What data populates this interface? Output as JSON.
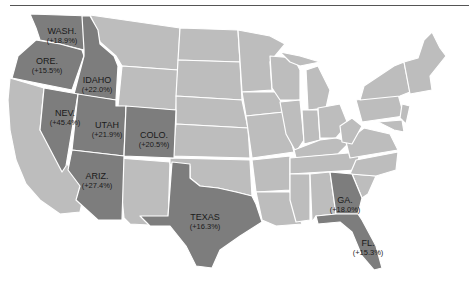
{
  "map": {
    "subject": "United States",
    "highlight_color": "#7d7d7d",
    "base_color": "#bdbdbd",
    "border_color": "#ffffff",
    "highlighted_states": [
      {
        "name": "WASH.",
        "value": "(+18.9%)"
      },
      {
        "name": "ORE.",
        "value": "(+15.5%)"
      },
      {
        "name": "IDAHO",
        "value": "(+22.0%)"
      },
      {
        "name": "NEV.",
        "value": "(+45.4%)"
      },
      {
        "name": "UTAH",
        "value": "(+21.9%)"
      },
      {
        "name": "COLO.",
        "value": "(+20.5%)"
      },
      {
        "name": "ARIZ.",
        "value": "(+27.4%)"
      },
      {
        "name": "TEXAS",
        "value": "(+16.3%)"
      },
      {
        "name": "GA.",
        "value": "(+18.0%)"
      },
      {
        "name": "FL.",
        "value": "(+15.3%)"
      }
    ]
  }
}
